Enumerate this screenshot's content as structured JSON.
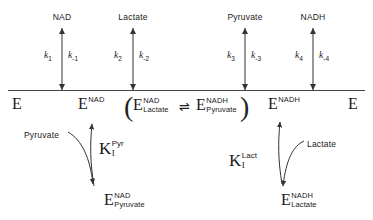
{
  "diagram": {
    "line_color": "#444444",
    "text_color": "#1a1a1a"
  },
  "top_labels": [
    {
      "text": "NAD",
      "x": 62
    },
    {
      "text": "Lactate",
      "x": 133
    },
    {
      "text": "Pyruvate",
      "x": 245
    },
    {
      "text": "NADH",
      "x": 313
    }
  ],
  "rate_constants": [
    {
      "forward": "k",
      "forward_sub": "1",
      "reverse": "k",
      "reverse_sub": "-1"
    },
    {
      "forward": "k",
      "forward_sub": "2",
      "reverse": "k",
      "reverse_sub": "-2"
    },
    {
      "forward": "k",
      "forward_sub": "3",
      "reverse": "k",
      "reverse_sub": "-3"
    },
    {
      "forward": "k",
      "forward_sub": "4",
      "reverse": "k",
      "reverse_sub": "-4"
    }
  ],
  "species": {
    "free_enzyme_left": {
      "base": "E",
      "sup": "",
      "sub": ""
    },
    "e_nad": {
      "base": "E",
      "sup": "NAD",
      "sub": ""
    },
    "e_nad_lactate": {
      "base": "E",
      "sup": "NAD",
      "sub": "Lactate"
    },
    "e_nadh_pyruvate": {
      "base": "E",
      "sup": "NADH",
      "sub": "Pyruvate"
    },
    "e_nadh": {
      "base": "E",
      "sup": "NADH",
      "sub": ""
    },
    "free_enzyme_right": {
      "base": "E",
      "sup": "",
      "sub": ""
    },
    "e_nad_pyruvate": {
      "base": "E",
      "sup": "NAD",
      "sub": "Pyruvate"
    },
    "e_nadh_lactate": {
      "base": "E",
      "sup": "NADH",
      "sub": "Lactate"
    }
  },
  "equilibrium_symbol": "⇌",
  "paren_open": "(",
  "paren_close": ")",
  "inhibition": {
    "pyruvate_branch": {
      "constant_base": "K",
      "constant_sub": "I",
      "constant_sup": "Pyr",
      "ligand_label": "Pyruvate"
    },
    "lactate_branch": {
      "constant_base": "K",
      "constant_sub": "I",
      "constant_sup": "Lact",
      "ligand_label": "Lactate"
    }
  }
}
